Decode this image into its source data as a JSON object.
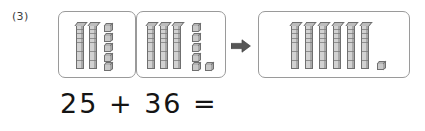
{
  "problem": {
    "number_label": "(3)",
    "equation_text": "25 + 36 =",
    "operation": "addition"
  },
  "arrow": {
    "icon": "arrow-right-icon",
    "color": "#555555"
  },
  "colors": {
    "block_fill": "#c9c9c9",
    "block_outline": "#6f6f6f",
    "panel_border": "#9a9a9a",
    "text": "#141414",
    "background": "#ffffff"
  },
  "panels": [
    {
      "name": "first-addend",
      "value": 25,
      "rods": 3,
      "rod_count": 2,
      "cube_count": 5,
      "units_per_rod": 10,
      "label": "25"
    },
    {
      "name": "second-addend",
      "value": 36,
      "rod_count": 3,
      "cube_count": 6,
      "units_per_rod": 10,
      "label": "36"
    },
    {
      "name": "sum",
      "value": 61,
      "rod_count": 6,
      "cube_count": 1,
      "units_per_rod": 10,
      "label": "61"
    }
  ],
  "chart_data": {
    "type": "bar",
    "categories": [
      "25",
      "36",
      "61"
    ],
    "values": [
      25,
      36,
      61
    ],
    "series": [
      {
        "name": "tens (rods)",
        "values": [
          2,
          3,
          6
        ]
      },
      {
        "name": "ones (cubes)",
        "values": [
          5,
          6,
          1
        ]
      }
    ],
    "xlabel": "",
    "ylabel": "",
    "ylim": [
      0,
      61
    ]
  }
}
